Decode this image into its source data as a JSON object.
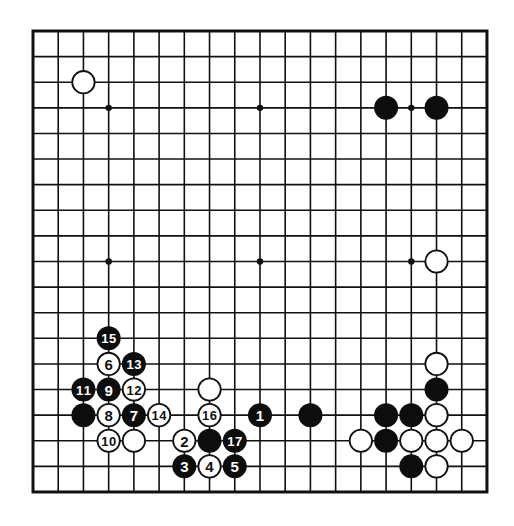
{
  "board": {
    "size": 19,
    "origin_x": 33,
    "origin_y": 31,
    "step_x": 25.22,
    "step_y": 25.61,
    "stone_radius": 12,
    "colors": {
      "line": "#111111",
      "black_stone": "#0d0d0d",
      "white_stone": "#ffffff",
      "black_label": "#ffffff",
      "white_label": "#111111",
      "background": "#ffffff"
    },
    "star_points": [
      [
        3,
        3
      ],
      [
        9,
        3
      ],
      [
        15,
        3
      ],
      [
        3,
        9
      ],
      [
        9,
        9
      ],
      [
        15,
        9
      ],
      [
        3,
        15
      ],
      [
        9,
        15
      ],
      [
        15,
        15
      ]
    ]
  },
  "stones": [
    {
      "color": "white",
      "col": 2,
      "row": 2,
      "label": ""
    },
    {
      "color": "black",
      "col": 14,
      "row": 3,
      "label": ""
    },
    {
      "color": "black",
      "col": 16,
      "row": 3,
      "label": ""
    },
    {
      "color": "white",
      "col": 16,
      "row": 9,
      "label": ""
    },
    {
      "color": "black",
      "col": 3,
      "row": 12,
      "label": "15"
    },
    {
      "color": "white",
      "col": 3,
      "row": 13,
      "label": "6"
    },
    {
      "color": "black",
      "col": 4,
      "row": 13,
      "label": "13"
    },
    {
      "color": "black",
      "col": 2,
      "row": 14,
      "label": "11"
    },
    {
      "color": "black",
      "col": 3,
      "row": 14,
      "label": "9"
    },
    {
      "color": "white",
      "col": 4,
      "row": 14,
      "label": "12"
    },
    {
      "color": "black",
      "col": 2,
      "row": 15,
      "label": ""
    },
    {
      "color": "white",
      "col": 3,
      "row": 15,
      "label": "8"
    },
    {
      "color": "black",
      "col": 4,
      "row": 15,
      "label": "7"
    },
    {
      "color": "white",
      "col": 5,
      "row": 15,
      "label": "14"
    },
    {
      "color": "white",
      "col": 3,
      "row": 16,
      "label": "10"
    },
    {
      "color": "white",
      "col": 4,
      "row": 16,
      "label": ""
    },
    {
      "color": "white",
      "col": 7,
      "row": 14,
      "label": ""
    },
    {
      "color": "white",
      "col": 7,
      "row": 15,
      "label": "16"
    },
    {
      "color": "black",
      "col": 9,
      "row": 15,
      "label": "1"
    },
    {
      "color": "black",
      "col": 11,
      "row": 15,
      "label": ""
    },
    {
      "color": "white",
      "col": 6,
      "row": 16,
      "label": "2"
    },
    {
      "color": "black",
      "col": 7,
      "row": 16,
      "label": ""
    },
    {
      "color": "black",
      "col": 8,
      "row": 16,
      "label": "17"
    },
    {
      "color": "black",
      "col": 6,
      "row": 17,
      "label": "3"
    },
    {
      "color": "white",
      "col": 7,
      "row": 17,
      "label": "4"
    },
    {
      "color": "black",
      "col": 8,
      "row": 17,
      "label": "5"
    },
    {
      "color": "white",
      "col": 16,
      "row": 13,
      "label": ""
    },
    {
      "color": "black",
      "col": 16,
      "row": 14,
      "label": ""
    },
    {
      "color": "black",
      "col": 14,
      "row": 15,
      "label": ""
    },
    {
      "color": "black",
      "col": 15,
      "row": 15,
      "label": ""
    },
    {
      "color": "white",
      "col": 16,
      "row": 15,
      "label": ""
    },
    {
      "color": "white",
      "col": 13,
      "row": 16,
      "label": ""
    },
    {
      "color": "black",
      "col": 14,
      "row": 16,
      "label": ""
    },
    {
      "color": "white",
      "col": 15,
      "row": 16,
      "label": ""
    },
    {
      "color": "white",
      "col": 16,
      "row": 16,
      "label": ""
    },
    {
      "color": "white",
      "col": 17,
      "row": 16,
      "label": ""
    },
    {
      "color": "black",
      "col": 15,
      "row": 17,
      "label": ""
    },
    {
      "color": "white",
      "col": 16,
      "row": 17,
      "label": ""
    }
  ]
}
